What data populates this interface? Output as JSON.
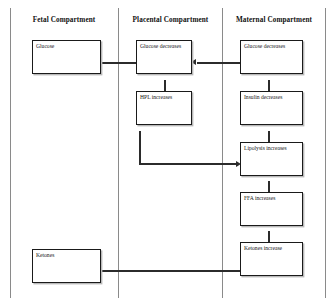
{
  "diagram": {
    "type": "flowchart",
    "columns": [
      {
        "id": "fetal",
        "label": "Fetal Compartment"
      },
      {
        "id": "placental",
        "label": "Placental Compartment"
      },
      {
        "id": "maternal",
        "label": "Maternal Compartment"
      }
    ],
    "nodes": [
      {
        "id": "fetal-glucose",
        "column": "fetal",
        "label": "Glucose"
      },
      {
        "id": "placental-glucose",
        "column": "placental",
        "label": "Glucose decreases"
      },
      {
        "id": "placental-hpl",
        "column": "placental",
        "label": "HPL increases"
      },
      {
        "id": "maternal-glucose",
        "column": "maternal",
        "label": "Glucose decreases"
      },
      {
        "id": "maternal-insulin",
        "column": "maternal",
        "label": "Insulin decreases"
      },
      {
        "id": "maternal-lipolysis",
        "column": "maternal",
        "label": "Lipolysis increases"
      },
      {
        "id": "maternal-ffa",
        "column": "maternal",
        "label": "FFA increases"
      },
      {
        "id": "maternal-ketones",
        "column": "maternal",
        "label": "Ketones increase"
      },
      {
        "id": "fetal-ketones",
        "column": "fetal",
        "label": "Ketones"
      }
    ],
    "edges": [
      {
        "from": "maternal-glucose",
        "to": "placental-glucose",
        "direction": "left"
      },
      {
        "from": "placental-glucose",
        "to": "fetal-glucose",
        "direction": "left"
      },
      {
        "from": "placental-glucose",
        "to": "placental-hpl",
        "direction": "down"
      },
      {
        "from": "maternal-glucose",
        "to": "maternal-insulin",
        "direction": "down"
      },
      {
        "from": "maternal-insulin",
        "to": "maternal-lipolysis",
        "direction": "down"
      },
      {
        "from": "placental-hpl",
        "to": "maternal-lipolysis",
        "direction": "right"
      },
      {
        "from": "maternal-lipolysis",
        "to": "maternal-ffa",
        "direction": "down"
      },
      {
        "from": "maternal-ffa",
        "to": "maternal-ketones",
        "direction": "down"
      },
      {
        "from": "maternal-ketones",
        "to": "fetal-ketones",
        "direction": "left"
      }
    ],
    "colors": {
      "background": "#ffffff",
      "node_border": "#1a1a1a",
      "node_fill": "#ffffff",
      "connector": "#2b2b2b",
      "divider": "#8a8a8a",
      "text": "#151515"
    }
  }
}
